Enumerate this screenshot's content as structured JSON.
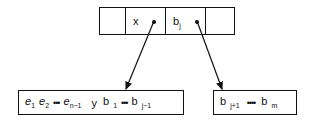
{
  "diagram": {
    "node": {
      "cells": [
        {
          "label": ""
        },
        {
          "label": "x",
          "pointer": true
        },
        {
          "label": "b",
          "sub": "j",
          "pointer": true
        },
        {
          "label": ""
        }
      ]
    },
    "left_box": {
      "items": [
        {
          "t": "e",
          "s": "1"
        },
        {
          "t": "e",
          "s": "2"
        },
        {
          "t": "•••",
          "s": ""
        },
        {
          "t": "e",
          "s": "n−1"
        },
        {
          "t": "y",
          "s": ""
        },
        {
          "t": "b",
          "s": "1"
        },
        {
          "t": "•••",
          "s": ""
        },
        {
          "t": "b",
          "s": "j−1"
        }
      ]
    },
    "right_box": {
      "items": [
        {
          "t": "b",
          "s": "j+1"
        },
        {
          "t": "••••",
          "s": ""
        },
        {
          "t": "b",
          "s": "m"
        }
      ]
    }
  }
}
